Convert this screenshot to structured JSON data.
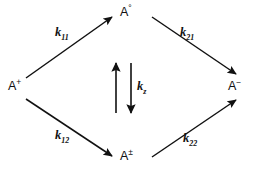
{
  "diagram": {
    "kind": "reaction-scheme",
    "background_color": "#ffffff",
    "ink_color": "#111111",
    "nodes": {
      "left": {
        "id": "a-plus",
        "base": "A",
        "superscript": "+"
      },
      "top": {
        "id": "a-zero",
        "base": "A",
        "superscript": "°"
      },
      "bottom": {
        "id": "a-pm",
        "base": "A",
        "superscript": "±"
      },
      "right": {
        "id": "a-minus",
        "base": "A",
        "superscript": "−"
      }
    },
    "rates": {
      "top_left": {
        "id": "k11",
        "symbol": "k",
        "subscript": "11",
        "from": "A+",
        "to": "A°"
      },
      "top_right": {
        "id": "k21",
        "symbol": "k",
        "subscript": "21",
        "from": "A°",
        "to": "A−"
      },
      "bottom_left": {
        "id": "k12",
        "symbol": "k",
        "subscript": "12",
        "from": "A+",
        "to": "A±"
      },
      "bottom_right": {
        "id": "k22",
        "symbol": "k",
        "subscript": "22",
        "from": "A±",
        "to": "A−"
      },
      "center": {
        "id": "kz",
        "symbol": "k",
        "subscript": "z",
        "from": "A±",
        "to": "A°"
      }
    },
    "arrows": [
      {
        "id": "arrow-k11",
        "from": "a-plus",
        "to": "a-zero",
        "direction": "up-right"
      },
      {
        "id": "arrow-k21",
        "from": "a-zero",
        "to": "a-minus",
        "direction": "down-right"
      },
      {
        "id": "arrow-k12",
        "from": "a-plus",
        "to": "a-pm",
        "direction": "down-right"
      },
      {
        "id": "arrow-k22",
        "from": "a-pm",
        "to": "a-minus",
        "direction": "up-right"
      },
      {
        "id": "arrow-kz-up",
        "from": "a-pm",
        "to": "a-zero",
        "direction": "up"
      },
      {
        "id": "arrow-kz-down",
        "from": "a-zero",
        "to": "a-pm",
        "direction": "down"
      }
    ]
  }
}
